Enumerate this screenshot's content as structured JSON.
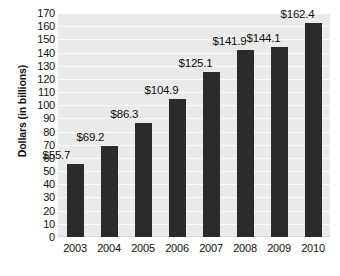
{
  "chart_data": {
    "type": "bar",
    "title": "",
    "xlabel": "",
    "ylabel": "Dollars (in billions)",
    "categories": [
      "2003",
      "2004",
      "2005",
      "2006",
      "2007",
      "2008",
      "2009",
      "2010"
    ],
    "values": [
      55.7,
      69.2,
      86.3,
      104.9,
      125.1,
      141.9,
      144.1,
      162.4
    ],
    "data_labels": [
      "$55.7",
      "$69.2",
      "$86.3",
      "$104.9",
      "$125.1",
      "$141.9",
      "$144.1",
      "$162.4"
    ],
    "ylim": [
      0,
      170
    ],
    "ytick_step": 10,
    "ytick_labels": [
      "170",
      "160",
      "150",
      "140",
      "130",
      "120",
      "110",
      "100",
      "90",
      "80",
      "70",
      "60",
      "50",
      "40",
      "30",
      "20",
      "10",
      "0"
    ],
    "grid": true,
    "grid_axis": "y",
    "legend": false,
    "legend_position": "none",
    "colors": {
      "bar": "#2b2b2b",
      "plot_background": "#eaeaea",
      "gridline": "#fbfbfb",
      "text": "#111111",
      "page_background": "#ffffff"
    }
  }
}
